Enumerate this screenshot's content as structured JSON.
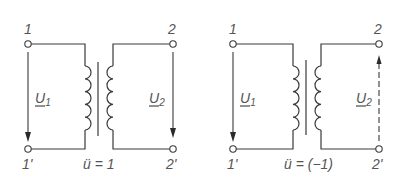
{
  "diagrams": [
    {
      "id": "same-polarity",
      "terminals": {
        "in_top": "1",
        "in_bottom": "1'",
        "out_top": "2",
        "out_bottom": "2'"
      },
      "voltages": {
        "primary": "U",
        "primary_sub": "1",
        "secondary": "U",
        "secondary_sub": "2"
      },
      "ratio_label": "ü = 1",
      "secondary_arrow_direction": "down"
    },
    {
      "id": "inverted-polarity",
      "terminals": {
        "in_top": "1",
        "in_bottom": "1'",
        "out_top": "2",
        "out_bottom": "2'"
      },
      "voltages": {
        "primary": "U",
        "primary_sub": "1",
        "secondary": "U",
        "secondary_sub": "2"
      },
      "ratio_label": "ü = (−1)",
      "secondary_arrow_direction": "up"
    }
  ],
  "colors": {
    "line": "#3a3a3a",
    "text": "#555555",
    "background": "#ffffff"
  }
}
